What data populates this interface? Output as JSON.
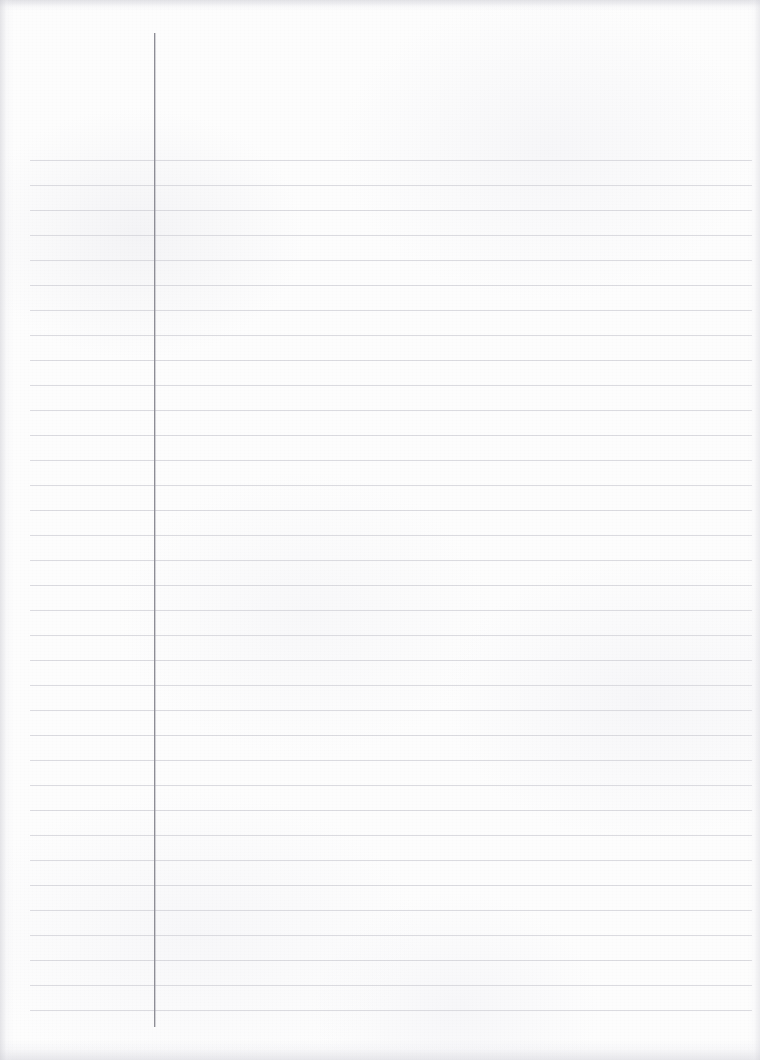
{
  "document": {
    "kind": "ruled-notebook-page",
    "title": "Blank Lined Paper",
    "page_width": 760,
    "page_height": 1060,
    "content_text": "",
    "is_blank": true
  },
  "paper": {
    "background_color": "#fdfdfd",
    "edge_shadow_color": "#d0d0d6",
    "texture": "faint scan grain"
  },
  "ruling": {
    "line_color": "#d9d9de",
    "line_thickness_px": 1,
    "first_line_y": 160,
    "line_spacing_px": 25,
    "line_count": 35,
    "line_left_x": 30,
    "line_right_x": 752
  },
  "margin_rule": {
    "line_color": "#8e8e96",
    "line_thickness_px": 1,
    "x": 154,
    "top_y": 33,
    "bottom_y": 1027,
    "label": "left margin rule"
  }
}
